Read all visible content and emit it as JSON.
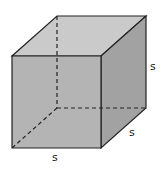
{
  "diagram": {
    "type": "cube",
    "labels": {
      "height": "s",
      "depth": "s",
      "width": "s"
    },
    "colors": {
      "front_face": "#b4b4b4",
      "top_face": "#cacaca",
      "right_face": "#a2a2a2",
      "edge": "#222222",
      "hidden_edge": "#222222"
    }
  }
}
